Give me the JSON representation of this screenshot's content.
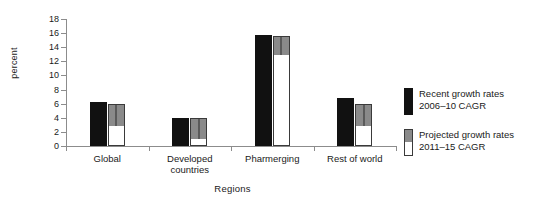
{
  "chart_data": {
    "type": "bar",
    "title": "",
    "xlabel": "Regions",
    "ylabel": "percent",
    "ylim": [
      0,
      18
    ],
    "yticks": [
      0,
      2,
      4,
      6,
      8,
      10,
      12,
      14,
      16,
      18
    ],
    "grid": false,
    "legend_position": "right",
    "categories": [
      "Global",
      "Developed\ncountries",
      "Pharmerging",
      "Rest of  world"
    ],
    "series": [
      {
        "name": "Recent growth rates 2006–10 CAGR",
        "color": "#111111",
        "values": [
          6.2,
          4.0,
          15.7,
          6.8
        ]
      },
      {
        "name": "Projected growth rates 2011–15 CAGR",
        "color": "#8a8a8a",
        "values": [
          6.0,
          4.0,
          15.6,
          6.0
        ],
        "segment_split": [
          3.0,
          1.2,
          13.0,
          3.0
        ]
      }
    ]
  },
  "axes": {
    "y_label": "percent",
    "x_label": "Regions",
    "y_tick_labels": [
      "0",
      "2",
      "4",
      "6",
      "8",
      "10",
      "12",
      "14",
      "16",
      "18"
    ]
  },
  "categories": [
    {
      "label": "Global"
    },
    {
      "label": "Developed\ncountries"
    },
    {
      "label": "Pharmerging"
    },
    {
      "label": "Rest of  world"
    }
  ],
  "legend": {
    "items": [
      {
        "swatch": "black",
        "line1": "Recent growth rates",
        "line2": "2006–10 CAGR",
        "text": "Recent growth rates\n2006–10 CAGR"
      },
      {
        "swatch": "gray-white",
        "line1": "Projected growth rates",
        "line2": "2011–15 CAGR",
        "text": "Projected growth rates\n2011–15 CAGR"
      }
    ]
  },
  "colors": {
    "recent": "#111111",
    "projected_upper": "#8a8a8a",
    "projected_lower": "#ffffff",
    "axis": "#8c8c8c",
    "text": "#1a1a1a",
    "background": "#ffffff"
  }
}
